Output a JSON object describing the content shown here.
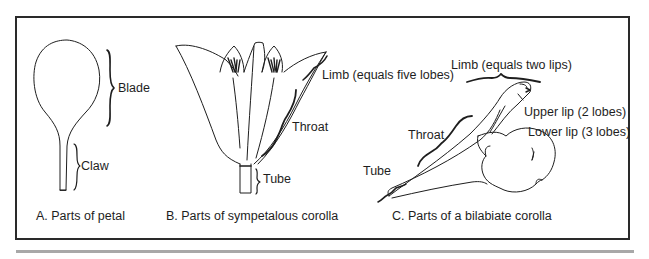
{
  "figure": {
    "panels": [
      {
        "id": "A",
        "caption": "A. Parts of petal",
        "labels": {
          "blade": "Blade",
          "claw": "Claw"
        }
      },
      {
        "id": "B",
        "caption": "B. Parts of sympetalous corolla",
        "labels": {
          "limb": "Limb (equals five lobes)",
          "throat": "Throat",
          "tube": "Tube"
        }
      },
      {
        "id": "C",
        "caption": "C. Parts of a bilabiate corolla",
        "labels": {
          "limb": "Limb (equals two lips)",
          "upper_lip": "Upper lip (2 lobes)",
          "lower_lip": "Lower lip (3 lobes)",
          "throat": "Throat",
          "tube": "Tube"
        }
      }
    ],
    "colors": {
      "line": "#1e1e1e",
      "frame": "#2a2a2a",
      "rule": "#a8a8a8",
      "background": "#ffffff"
    }
  }
}
